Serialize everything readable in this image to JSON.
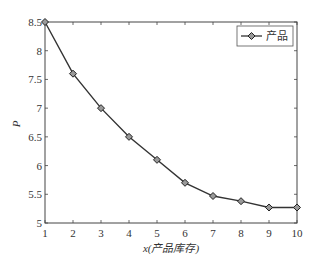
{
  "chart_data": {
    "type": "line",
    "title": "",
    "xlabel": "x(产品库存)",
    "ylabel": "P",
    "xlim": [
      1,
      10
    ],
    "ylim": [
      5,
      8.5
    ],
    "x_ticks": [
      "1",
      "2",
      "3",
      "4",
      "5",
      "6",
      "7",
      "8",
      "9",
      "10"
    ],
    "y_ticks": [
      "5",
      "5.5",
      "6",
      "6.5",
      "7",
      "7.5",
      "8",
      "8.5"
    ],
    "grid": false,
    "legend_position": "upper right",
    "series": [
      {
        "name": "产品",
        "marker": "diamond",
        "color": "#333333",
        "x": [
          1,
          2,
          3,
          4,
          5,
          6,
          7,
          8,
          9,
          10
        ],
        "values": [
          8.5,
          7.6,
          7.0,
          6.5,
          6.1,
          5.7,
          5.47,
          5.38,
          5.27,
          5.27
        ]
      }
    ]
  }
}
